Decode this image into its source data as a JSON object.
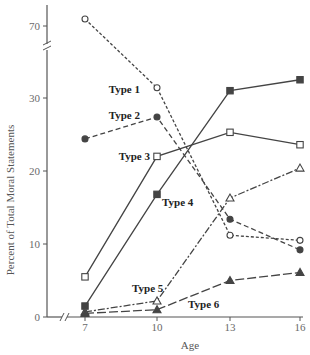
{
  "chart_data": {
    "type": "line",
    "title": "",
    "xlabel": "Age",
    "ylabel": "Percent of Total Moral Statements",
    "x": [
      7,
      10,
      13,
      16
    ],
    "x_tick_labels": [
      "7",
      "10",
      "13",
      "16"
    ],
    "y_tick_labels": [
      "0",
      "10",
      "20",
      "30",
      "70"
    ],
    "ylim": [
      0,
      75
    ],
    "y_axis_break": [
      35,
      68
    ],
    "grid": false,
    "legend_position": "inline labels",
    "series": [
      {
        "name": "Type 1",
        "marker": "open-circle",
        "line": "short-dash",
        "values": [
          72,
          31.4,
          11.2,
          10.5
        ]
      },
      {
        "name": "Type 2",
        "marker": "filled-circle",
        "line": "dash",
        "values": [
          24.4,
          27.4,
          13.4,
          9.2
        ]
      },
      {
        "name": "Type 3",
        "marker": "open-square",
        "line": "solid",
        "values": [
          5.5,
          22.0,
          25.3,
          23.6
        ]
      },
      {
        "name": "Type 4",
        "marker": "filled-square",
        "line": "solid",
        "values": [
          1.5,
          16.8,
          31.0,
          32.5
        ]
      },
      {
        "name": "Type 5",
        "marker": "open-triangle",
        "line": "dash-dot",
        "values": [
          0.7,
          2.2,
          16.3,
          20.4
        ]
      },
      {
        "name": "Type 6",
        "marker": "filled-triangle",
        "line": "long-dash",
        "values": [
          0.5,
          1.0,
          5.0,
          6.1
        ]
      }
    ]
  }
}
